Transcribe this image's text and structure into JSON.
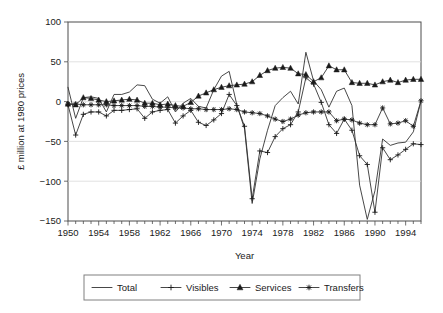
{
  "chart_data": {
    "type": "line",
    "title": "",
    "xlabel": "Year",
    "ylabel": "£ million at 1980 prices",
    "xlim": [
      1950,
      1996
    ],
    "ylim": [
      -150,
      100
    ],
    "yticks": [
      100,
      50,
      0,
      -50,
      -100,
      -150
    ],
    "ytick_labels": [
      "100",
      "50",
      "0",
      "−50",
      "−100",
      "−150"
    ],
    "xticks": [
      1950,
      1954,
      1958,
      1962,
      1966,
      1970,
      1974,
      1978,
      1982,
      1986,
      1990,
      1994
    ],
    "xtick_labels": [
      "1950",
      "1954",
      "1958",
      "1962",
      "1966",
      "1970",
      "1974",
      "1978",
      "1982",
      "1986",
      "1990",
      "1994"
    ],
    "minor_xtick_step": 1,
    "grid": "horizontal",
    "legend_position": "bottom",
    "x": [
      1950,
      1951,
      1952,
      1953,
      1954,
      1955,
      1956,
      1957,
      1958,
      1959,
      1960,
      1961,
      1962,
      1963,
      1964,
      1965,
      1966,
      1967,
      1968,
      1969,
      1970,
      1971,
      1972,
      1973,
      1974,
      1975,
      1976,
      1977,
      1978,
      1979,
      1980,
      1981,
      1982,
      1983,
      1984,
      1985,
      1986,
      1987,
      1988,
      1989,
      1990,
      1991,
      1992,
      1993,
      1994,
      1995,
      1996
    ],
    "series": [
      {
        "name": "Total",
        "marker": "none",
        "values": [
          18,
          -21,
          5,
          6,
          4,
          -13,
          9,
          9,
          12,
          21,
          20,
          3,
          -2,
          6,
          -13,
          -2,
          4,
          -6,
          -8,
          15,
          32,
          38,
          -4,
          -34,
          -128,
          -72,
          -36,
          -5,
          5,
          13,
          -3,
          62,
          26,
          15,
          -7,
          13,
          17,
          -5,
          -105,
          -148,
          -112,
          -47,
          -55,
          -52,
          -51,
          -38,
          1
        ]
      },
      {
        "name": "Visibles",
        "marker": "plus",
        "values": [
          -4,
          -42,
          -16,
          -13,
          -13,
          -18,
          -11,
          -11,
          -10,
          -9,
          -21,
          -13,
          -11,
          -10,
          -27,
          -18,
          -11,
          -26,
          -30,
          -23,
          -15,
          9,
          -5,
          -31,
          -122,
          -62,
          -64,
          -44,
          -34,
          -29,
          -13,
          30,
          22,
          -1,
          -29,
          -40,
          -22,
          -36,
          -68,
          -79,
          -139,
          -58,
          -73,
          -67,
          -60,
          -53,
          -54
        ]
      },
      {
        "name": "Services",
        "marker": "triangle",
        "values": [
          -3,
          -4,
          5,
          4,
          2,
          0,
          1,
          2,
          3,
          2,
          -2,
          -2,
          -4,
          -3,
          -5,
          -6,
          -1,
          7,
          11,
          15,
          18,
          20,
          21,
          22,
          25,
          33,
          39,
          42,
          43,
          42,
          35,
          34,
          25,
          30,
          45,
          40,
          40,
          24,
          23,
          23,
          21,
          25,
          27,
          24,
          27,
          28,
          28
        ]
      },
      {
        "name": "Transfers",
        "marker": "asterisk",
        "values": [
          -3,
          -3,
          -4,
          -4,
          -4,
          -4,
          -5,
          -5,
          -5,
          -5,
          -6,
          -6,
          -7,
          -7,
          -8,
          -8,
          -9,
          -9,
          -10,
          -10,
          -10,
          -9,
          -10,
          -13,
          -14,
          -15,
          -18,
          -22,
          -25,
          -22,
          -17,
          -14,
          -13,
          -13,
          -13,
          -24,
          -22,
          -23,
          -27,
          -29,
          -29,
          -8,
          -28,
          -27,
          -24,
          -31,
          1
        ]
      }
    ]
  },
  "legend": {
    "items": [
      {
        "label": "Total",
        "marker": "none"
      },
      {
        "label": "Visibles",
        "marker": "plus"
      },
      {
        "label": "Services",
        "marker": "triangle"
      },
      {
        "label": "Transfers",
        "marker": "asterisk"
      }
    ]
  },
  "colors": {
    "line": "#333333",
    "marker": "#1a1a1a",
    "grid": "#d9d9d9",
    "axis": "#4d4d4d",
    "background": "#ffffff"
  }
}
